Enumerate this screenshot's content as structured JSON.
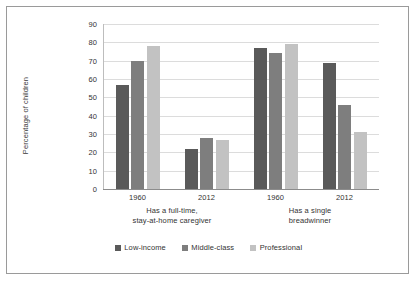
{
  "chart_data": {
    "type": "bar",
    "title": "",
    "xlabel": "",
    "ylabel": "Percentage of children",
    "ylim": [
      0,
      90
    ],
    "yticks": [
      0,
      10,
      20,
      30,
      40,
      50,
      60,
      70,
      80,
      90
    ],
    "grid": true,
    "legend_position": "bottom",
    "categories": [
      "1960",
      "2012",
      "1960",
      "2012"
    ],
    "group_labels": [
      "Has a full-time,\nstay-at-home caregiver",
      "Has a single\nbreadwinner"
    ],
    "groups": [
      {
        "label": "Has a full-time, stay-at-home caregiver",
        "label_line1": "Has a full-time,",
        "label_line2": "stay-at-home caregiver",
        "years": [
          "1960",
          "2012"
        ]
      },
      {
        "label": "Has a single breadwinner",
        "label_line1": "Has a single",
        "label_line2": "breadwinner",
        "years": [
          "1960",
          "2012"
        ]
      }
    ],
    "series": [
      {
        "name": "Low-income",
        "color": "#5a5a5a",
        "values": [
          57,
          22,
          77,
          69
        ]
      },
      {
        "name": "Middle-class",
        "color": "#7e7e7e",
        "values": [
          70,
          28,
          74,
          46
        ]
      },
      {
        "name": "Professional",
        "color": "#c2c2c2",
        "values": [
          78,
          27,
          79,
          31
        ]
      }
    ]
  },
  "axis": {
    "y_title": "Percentage of children",
    "y_tick_labels": [
      "90",
      "80",
      "70",
      "60",
      "50",
      "40",
      "30",
      "20",
      "10",
      "0"
    ],
    "x_tick_labels": [
      "1960",
      "2012",
      "1960",
      "2012"
    ]
  },
  "legend": {
    "items": [
      {
        "label": "Low-income",
        "color": "#5a5a5a"
      },
      {
        "label": "Middle-class",
        "color": "#7e7e7e"
      },
      {
        "label": "Professional",
        "color": "#c2c2c2"
      }
    ]
  },
  "colors": {
    "border": "#9a9a9a",
    "gridline": "#dcdcdc",
    "axis": "#8c8c8c",
    "text": "#333333",
    "background": "#ffffff"
  }
}
